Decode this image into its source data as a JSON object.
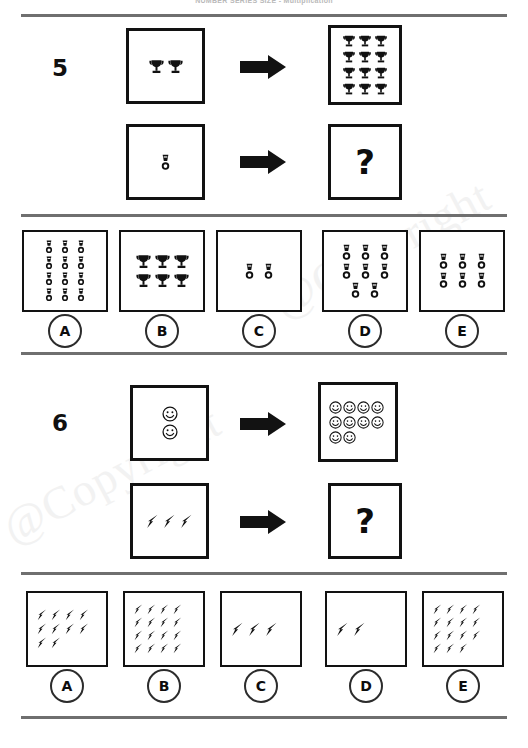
{
  "header": {
    "text": "NUMBER SERIES SIZE - Multiplication"
  },
  "watermarks": [
    {
      "text": "@Copyright"
    },
    {
      "text": "@Copyright"
    }
  ],
  "icons": {
    "trophy": "trophy-icon",
    "medal": "medal-icon",
    "smiley": "smiley-face-icon",
    "bolt": "lightning-bolt-icon",
    "arrow": "right-arrow-icon",
    "question": "question-mark"
  },
  "questions": [
    {
      "number": "5",
      "rows": [
        {
          "left": {
            "icon": "trophy",
            "rows": [
              2
            ],
            "count": 2
          },
          "arrow": "right-arrow-icon",
          "right": {
            "icon": "trophy",
            "rows": [
              3,
              3,
              3,
              3
            ],
            "count": 12
          }
        },
        {
          "left": {
            "icon": "medal",
            "rows": [
              1
            ],
            "count": 1
          },
          "arrow": "right-arrow-icon",
          "right": {
            "text": "?"
          }
        }
      ],
      "options": [
        {
          "label": "A",
          "icon": "medal",
          "rows": [
            3,
            3,
            3,
            3
          ],
          "count": 12
        },
        {
          "label": "B",
          "icon": "trophy",
          "rows": [
            3,
            3
          ],
          "count": 6
        },
        {
          "label": "C",
          "icon": "medal",
          "rows": [
            2
          ],
          "count": 2
        },
        {
          "label": "D",
          "icon": "medal",
          "rows": [
            3,
            3,
            2
          ],
          "count": 8
        },
        {
          "label": "E",
          "icon": "medal",
          "rows": [
            3,
            3
          ],
          "count": 6
        }
      ]
    },
    {
      "number": "6",
      "rows": [
        {
          "left": {
            "icon": "smiley",
            "rows": [
              1,
              1
            ],
            "count": 2
          },
          "arrow": "right-arrow-icon",
          "right": {
            "icon": "smiley",
            "rows": [
              4,
              4,
              2
            ],
            "count": 10
          }
        },
        {
          "left": {
            "icon": "bolt",
            "rows": [
              3
            ],
            "count": 3
          },
          "arrow": "right-arrow-icon",
          "right": {
            "text": "?"
          }
        }
      ],
      "options": [
        {
          "label": "A",
          "icon": "bolt",
          "rows": [
            4,
            4,
            2
          ],
          "count": 10
        },
        {
          "label": "B",
          "icon": "bolt",
          "rows": [
            4,
            4,
            4,
            4
          ],
          "count": 16
        },
        {
          "label": "C",
          "icon": "bolt",
          "rows": [
            3
          ],
          "count": 3
        },
        {
          "label": "D",
          "icon": "bolt",
          "rows": [
            2
          ],
          "count": 2
        },
        {
          "label": "E",
          "icon": "bolt",
          "rows": [
            4,
            4,
            4,
            3
          ],
          "count": 15
        }
      ]
    }
  ],
  "colors": {
    "ink": "#121212",
    "divider": "#6f6f6f",
    "watermark": "#f2f2f2",
    "paper": "#ffffff"
  }
}
